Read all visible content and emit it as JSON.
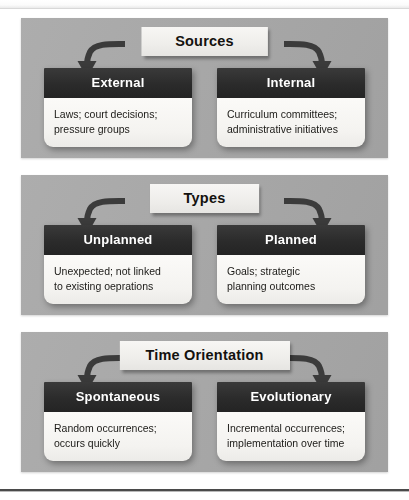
{
  "diagram": {
    "panel_color": "#a8a8a8",
    "header_color": "#2f2f2f",
    "title_box_color": "#f2f1ee",
    "body_color": "#f6f5f2",
    "panels": [
      {
        "title": "Sources",
        "cards": [
          {
            "heading": "External",
            "lines": [
              "Laws; court decisions;",
              "pressure groups"
            ]
          },
          {
            "heading": "Internal",
            "lines": [
              "Curriculum committees;",
              "administrative initiatives"
            ]
          }
        ]
      },
      {
        "title": "Types",
        "cards": [
          {
            "heading": "Unplanned",
            "lines": [
              "Unexpected; not linked",
              "to existing oeprations"
            ]
          },
          {
            "heading": "Planned",
            "lines": [
              "Goals; strategic",
              "planning outcomes"
            ]
          }
        ]
      },
      {
        "title": "Time Orientation",
        "cards": [
          {
            "heading": "Spontaneous",
            "lines": [
              "Random occurrences;",
              "occurs quickly"
            ]
          },
          {
            "heading": "Evolutionary",
            "lines": [
              "Incremental occurrences;",
              "implementation over time"
            ]
          }
        ]
      }
    ]
  }
}
